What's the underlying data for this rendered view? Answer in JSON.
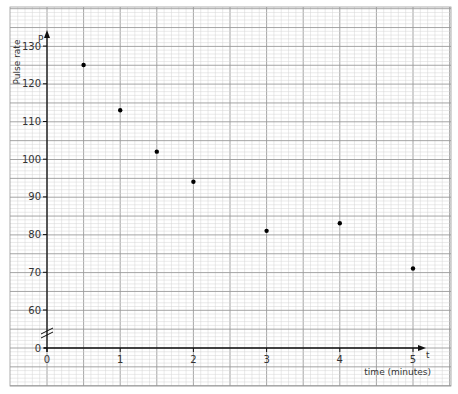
{
  "chart_data": {
    "type": "scatter",
    "title": "",
    "xlabel": "time (minutes)",
    "ylabel": "Pulse rate",
    "x_axis_symbol": "t",
    "y_axis_symbol": "P",
    "xlim": [
      0,
      5.3
    ],
    "ylim_display": [
      0,
      130
    ],
    "y_axis_break": "between 0 and 60",
    "x_ticks": [
      "0",
      "1",
      "2",
      "3",
      "4",
      "5"
    ],
    "y_ticks": [
      "0",
      "60",
      "70",
      "80",
      "90",
      "100",
      "110",
      "120",
      "130"
    ],
    "grid": true,
    "legend": null,
    "series": [
      {
        "name": "Pulse rate",
        "points": [
          {
            "x": 0.5,
            "y": 125
          },
          {
            "x": 1,
            "y": 113
          },
          {
            "x": 1.5,
            "y": 102
          },
          {
            "x": 2,
            "y": 94
          },
          {
            "x": 3,
            "y": 81
          },
          {
            "x": 4,
            "y": 83
          },
          {
            "x": 5,
            "y": 71
          }
        ]
      }
    ]
  },
  "colors": {
    "minor_grid": "#d4d4d4",
    "major_grid": "#9a9a9a",
    "axis": "#111111",
    "point": "#000000"
  }
}
